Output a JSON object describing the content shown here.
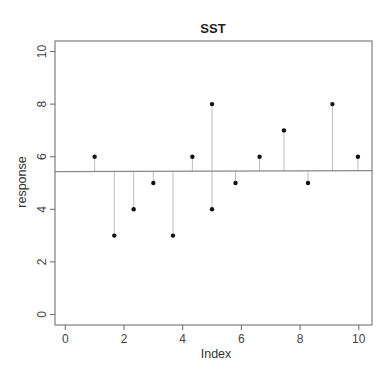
{
  "chart_data": {
    "type": "scatter",
    "subtype": "residual-stem-plot",
    "title": "SST",
    "xlabel": "Index",
    "ylabel": "response",
    "xlim": [
      -0.35,
      10.45
    ],
    "ylim": [
      -0.4,
      10.4
    ],
    "x_ticks": [
      0,
      2,
      4,
      6,
      8,
      10
    ],
    "y_ticks": [
      0,
      2,
      4,
      6,
      8,
      10
    ],
    "grid": false,
    "legend": null,
    "mean_line": {
      "y_left": 5.43,
      "y_right": 5.47,
      "label": "overall mean"
    },
    "points": [
      {
        "x": 1.0,
        "y": 6
      },
      {
        "x": 1.67,
        "y": 3
      },
      {
        "x": 2.33,
        "y": 4
      },
      {
        "x": 3.0,
        "y": 5
      },
      {
        "x": 3.67,
        "y": 3
      },
      {
        "x": 4.33,
        "y": 6
      },
      {
        "x": 5.0,
        "y": 8
      },
      {
        "x": 5.0,
        "y": 4
      },
      {
        "x": 5.8,
        "y": 5
      },
      {
        "x": 6.62,
        "y": 6
      },
      {
        "x": 7.45,
        "y": 7
      },
      {
        "x": 8.27,
        "y": 5
      },
      {
        "x": 9.1,
        "y": 8
      },
      {
        "x": 9.97,
        "y": 6
      }
    ]
  },
  "colors": {
    "points": "#111111",
    "stems": "#bdbdbd",
    "mean_line": "#888888",
    "frame": "#666666"
  }
}
